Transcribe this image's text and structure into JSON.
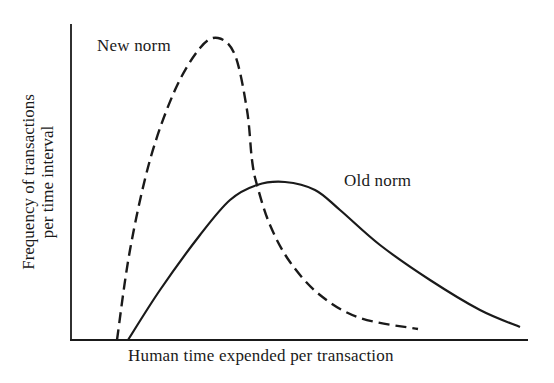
{
  "chart_data": {
    "type": "line",
    "title": "",
    "xlabel": "Human time expended per transaction",
    "ylabel_lines": [
      "Frequency of transactions",
      "per time interval"
    ],
    "grid": false,
    "axis_ticks": false,
    "series": [
      {
        "name": "New norm",
        "style": "dashed",
        "description": "narrow, tall distribution peaking early",
        "points_px": [
          [
            117,
            340
          ],
          [
            130,
            250
          ],
          [
            150,
            160
          ],
          [
            175,
            90
          ],
          [
            200,
            48
          ],
          [
            218,
            38
          ],
          [
            235,
            55
          ],
          [
            247,
            110
          ],
          [
            252,
            160
          ],
          [
            257,
            185
          ],
          [
            270,
            225
          ],
          [
            290,
            262
          ],
          [
            320,
            295
          ],
          [
            360,
            318
          ],
          [
            418,
            329
          ]
        ]
      },
      {
        "name": "Old norm",
        "style": "solid",
        "description": "wide, lower distribution peaking later",
        "points_px": [
          [
            128,
            340
          ],
          [
            160,
            290
          ],
          [
            200,
            235
          ],
          [
            230,
            200
          ],
          [
            257,
            185
          ],
          [
            285,
            182
          ],
          [
            315,
            190
          ],
          [
            340,
            210
          ],
          [
            380,
            245
          ],
          [
            430,
            280
          ],
          [
            480,
            310
          ],
          [
            520,
            327
          ]
        ]
      }
    ],
    "annotations": [
      {
        "text": "New norm",
        "near": "dashed peak"
      },
      {
        "text": "Old norm",
        "near": "solid peak"
      }
    ]
  },
  "labels": {
    "new_norm": "New norm",
    "old_norm": "Old norm",
    "xlabel": "Human time expended per transaction",
    "ylabel1": "Frequency of transactions",
    "ylabel2": "per time interval"
  }
}
